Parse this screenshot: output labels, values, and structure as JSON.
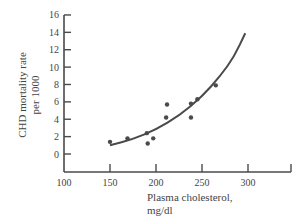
{
  "chart_data": {
    "type": "scatter",
    "title": "",
    "xlabel": "Plasma cholesterol, mg/dl",
    "xlabel_lines": [
      "Plasma cholesterol,",
      "mg/dl"
    ],
    "ylabel": "CHD mortality rate per 1000",
    "ylabel_lines": [
      "CHD mortality rate",
      "per 1000"
    ],
    "xlim": [
      100,
      345
    ],
    "ylim": [
      -3.5,
      16
    ],
    "x_ticks": [
      100,
      150,
      200,
      250,
      300
    ],
    "y_ticks": [
      0,
      2,
      4,
      6,
      8,
      10,
      12,
      14,
      16
    ],
    "grid": false,
    "legend": null,
    "series": [
      {
        "name": "observations",
        "kind": "scatter",
        "points": [
          {
            "x": 150,
            "y": 1.4
          },
          {
            "x": 169,
            "y": 1.8
          },
          {
            "x": 190,
            "y": 2.4
          },
          {
            "x": 191,
            "y": 1.2
          },
          {
            "x": 197,
            "y": 1.8
          },
          {
            "x": 211,
            "y": 4.2
          },
          {
            "x": 212,
            "y": 5.7
          },
          {
            "x": 238,
            "y": 4.2
          },
          {
            "x": 238,
            "y": 5.8
          },
          {
            "x": 245,
            "y": 6.3
          },
          {
            "x": 265,
            "y": 7.9
          }
        ]
      },
      {
        "name": "fitted curve",
        "kind": "line",
        "points": [
          {
            "x": 150,
            "y": 1.0
          },
          {
            "x": 175,
            "y": 1.7
          },
          {
            "x": 200,
            "y": 2.8
          },
          {
            "x": 225,
            "y": 4.4
          },
          {
            "x": 250,
            "y": 6.6
          },
          {
            "x": 270,
            "y": 9.0
          },
          {
            "x": 285,
            "y": 11.2
          },
          {
            "x": 297,
            "y": 13.9
          }
        ]
      }
    ]
  },
  "colors": {
    "ink": "#4a4a4a",
    "background": "#ffffff"
  }
}
